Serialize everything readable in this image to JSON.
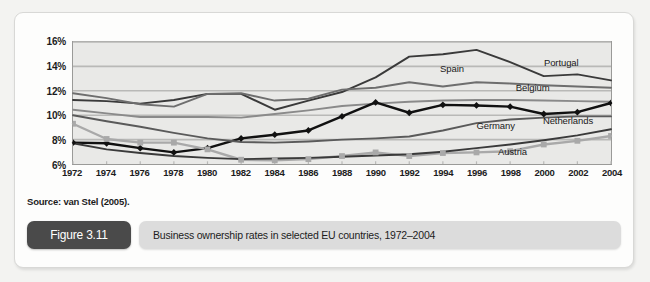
{
  "figure": {
    "badge": "Figure 3.11",
    "caption": "Business ownership rates in selected EU countries, 1972–2004",
    "source": "Source: van Stel (2005)."
  },
  "colors": {
    "plot_background": "#e9e9e7",
    "frame": "#9a9a98",
    "gridline": "#b9b9b7",
    "netherlands": "#111111",
    "portugal": "#3a3a3a",
    "spain": "#6e6e6e",
    "belgium": "#8a8a8a",
    "germany": "#5a5a5a",
    "austria": "#a9a9a9",
    "badge_background": "#4a4a4a",
    "caption_background": "#dcdcdc"
  },
  "chart_data": {
    "type": "line",
    "title": "Business ownership rates in selected EU countries, 1972–2004",
    "xlabel": "",
    "ylabel": "",
    "xlim": [
      1972,
      2004
    ],
    "ylim": [
      6,
      16
    ],
    "ytick_labels": [
      "6%",
      "8%",
      "10%",
      "12%",
      "14%",
      "16%"
    ],
    "yticks": [
      6,
      8,
      10,
      12,
      14,
      16
    ],
    "grid": true,
    "legend_position": "inline-right-labels",
    "x": [
      1972,
      1974,
      1976,
      1978,
      1980,
      1982,
      1984,
      1986,
      1988,
      1990,
      1992,
      1994,
      1996,
      1998,
      2000,
      2002,
      2004
    ],
    "categories": [
      "1972",
      "1974",
      "1976",
      "1978",
      "1980",
      "1982",
      "1984",
      "1986",
      "1988",
      "1990",
      "1992",
      "1994",
      "1996",
      "1998",
      "2000",
      "2002",
      "2004"
    ],
    "series": [
      {
        "name": "Portugal",
        "color": "#3a3a3a",
        "marker": "none",
        "label_x": 2001.1,
        "label_y": 14.25,
        "values": [
          11.25,
          11.15,
          10.95,
          11.25,
          11.75,
          11.75,
          10.45,
          11.2,
          11.9,
          13.1,
          14.8,
          15.0,
          15.35,
          14.35,
          13.2,
          13.35,
          12.85
        ]
      },
      {
        "name": "Spain",
        "color": "#6e6e6e",
        "marker": "none",
        "label_x": 1994.6,
        "label_y": 13.75,
        "values": [
          11.8,
          11.4,
          10.9,
          10.7,
          11.75,
          11.8,
          11.2,
          11.35,
          12.1,
          12.25,
          12.7,
          12.35,
          12.7,
          12.6,
          12.45,
          12.35,
          12.25
        ]
      },
      {
        "name": "Belgium",
        "color": "#8a8a8a",
        "marker": "none",
        "label_x": 1999.4,
        "label_y": 12.25,
        "values": [
          10.45,
          10.15,
          9.85,
          9.85,
          9.85,
          9.8,
          10.1,
          10.4,
          10.75,
          10.95,
          11.1,
          11.2,
          11.25,
          11.25,
          11.2,
          11.15,
          11.1
        ]
      },
      {
        "name": "Netherlands",
        "color": "#111111",
        "marker": "diamond",
        "label_x": 2001.5,
        "label_y": 9.55,
        "values": [
          7.75,
          7.7,
          7.3,
          6.95,
          7.3,
          8.1,
          8.4,
          8.75,
          9.9,
          11.05,
          10.2,
          10.85,
          10.8,
          10.7,
          10.1,
          10.25,
          11.0
        ]
      },
      {
        "name": "Germany",
        "color": "#5a5a5a",
        "marker": "none",
        "label_x": 1997.2,
        "label_y": 9.15,
        "values": [
          10.0,
          9.5,
          9.05,
          8.55,
          8.1,
          7.8,
          7.75,
          7.85,
          8.0,
          8.1,
          8.25,
          8.75,
          9.35,
          9.65,
          9.8,
          9.9,
          9.9
        ]
      },
      {
        "name": "Austria",
        "color": "#a9a9a9",
        "marker": "square",
        "label_x": 1998.2,
        "label_y": 7.0,
        "values": [
          9.3,
          8.05,
          7.75,
          7.75,
          7.2,
          6.35,
          6.3,
          6.4,
          6.65,
          6.95,
          6.65,
          6.9,
          6.95,
          7.05,
          7.6,
          7.9,
          8.3
        ]
      },
      {
        "name": "Lower bound trend",
        "color": "#3a3a3a",
        "marker": "none",
        "label_x": null,
        "label_y": null,
        "values": [
          7.7,
          7.2,
          6.9,
          6.65,
          6.5,
          6.4,
          6.45,
          6.5,
          6.6,
          6.7,
          6.8,
          7.0,
          7.3,
          7.6,
          7.95,
          8.35,
          8.85
        ]
      }
    ]
  }
}
